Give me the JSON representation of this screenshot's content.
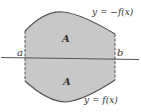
{
  "figure": {
    "labels": {
      "top_curve": "y = −f(x)",
      "bottom_curve": "y = f(x)",
      "left_bound": "a",
      "right_bound": "b",
      "area_upper": "A",
      "area_lower": "A"
    },
    "colors": {
      "fill": "#c8c8c8",
      "stroke": "#555555",
      "axis": "#555555",
      "text": "#333333"
    }
  }
}
